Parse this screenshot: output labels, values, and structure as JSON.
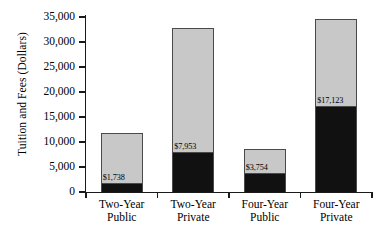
{
  "chart_data": {
    "type": "bar",
    "subtype": "stacked-bar",
    "title": "",
    "xlabel": "",
    "ylabel": "Tuition and Fees (Dollars)",
    "ylim": [
      0,
      35000
    ],
    "yticks": [
      0,
      5000,
      10000,
      15000,
      20000,
      25000,
      30000,
      35000
    ],
    "ytick_labels": [
      "0",
      "5,000",
      "10,000",
      "15,000",
      "20,000",
      "25,000",
      "30,000",
      "35,000"
    ],
    "grid": false,
    "legend": null,
    "categories": [
      "Two-Year Public",
      "Two-Year Private",
      "Four-Year Public",
      "Four-Year Private"
    ],
    "category_lines": [
      [
        "Two-Year",
        "Public"
      ],
      [
        "Two-Year",
        "Private"
      ],
      [
        "Four-Year",
        "Public"
      ],
      [
        "Four-Year",
        "Private"
      ]
    ],
    "series": [
      {
        "name": "Tuition and Fees",
        "color": "#111111",
        "values": [
          1738,
          7953,
          3754,
          17123
        ],
        "labels": [
          "$1,738",
          "$7,953",
          "$3,754",
          "$17,123"
        ]
      },
      {
        "name": "Remaining Cost",
        "color": "#c8c8c8",
        "values": [
          10162,
          24947,
          4946,
          17577
        ],
        "labels": [
          "",
          "",
          "",
          ""
        ]
      }
    ],
    "totals": [
      11900,
      32900,
      8700,
      34700
    ],
    "annotations": [
      {
        "category": "Two-Year Public",
        "text": "$1,738"
      },
      {
        "category": "Two-Year Private",
        "text": "$7,953"
      },
      {
        "category": "Four-Year Public",
        "text": "$3,754"
      },
      {
        "category": "Four-Year Private",
        "text": "$17,123"
      }
    ],
    "colors": {
      "bar_bottom": "#111111",
      "bar_top": "#c8c8c8",
      "bar_border": "#4a4a4a",
      "axis": "#1a1a1a",
      "background": "#ffffff",
      "text": "#000000"
    }
  }
}
